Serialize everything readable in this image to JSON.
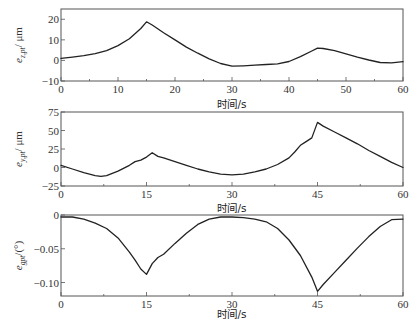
{
  "chart_data": [
    {
      "type": "line",
      "title": "",
      "xlabel": "时间/s",
      "ylabel": {
        "main": "e",
        "sub": "z,pt",
        "unit": "/ μm"
      },
      "xlim": [
        0,
        60
      ],
      "ylim": [
        -10,
        25
      ],
      "xticks": [
        0,
        10,
        20,
        30,
        40,
        50,
        60
      ],
      "xtick_labels": [
        "0",
        "10",
        "20",
        "30",
        "40",
        "50",
        "60"
      ],
      "xminor": [
        5,
        15,
        25,
        35,
        45,
        55
      ],
      "yticks": [
        -10,
        0,
        10,
        20
      ],
      "ytick_labels": [
        "−10",
        "0",
        "10",
        "20"
      ],
      "grid": false,
      "series": [
        {
          "name": "e_z,pt",
          "x": [
            0,
            2,
            4,
            6,
            8,
            10,
            12,
            14,
            15,
            16,
            18,
            20,
            22,
            24,
            26,
            28,
            30,
            32,
            34,
            36,
            38,
            40,
            42,
            44,
            45,
            46,
            48,
            50,
            52,
            54,
            56,
            58,
            60
          ],
          "y": [
            1,
            1.6,
            2.3,
            3.3,
            4.8,
            7.2,
            10.5,
            15.5,
            18.8,
            17.2,
            13.5,
            10,
            6.5,
            3.5,
            0.8,
            -1.5,
            -2.8,
            -2.6,
            -2.3,
            -2.0,
            -1.7,
            -0.5,
            1.8,
            4.6,
            6.0,
            5.8,
            4.8,
            3.2,
            1.6,
            0.2,
            -1.0,
            -1.2,
            -0.6
          ]
        }
      ]
    },
    {
      "type": "line",
      "title": "",
      "xlabel": "时间/s",
      "ylabel": {
        "main": "e",
        "sub": "y,pt",
        "unit": "/ μm"
      },
      "xlim": [
        0,
        60
      ],
      "ylim": [
        -25,
        75
      ],
      "xticks": [
        0,
        15,
        30,
        45,
        60
      ],
      "xtick_labels": [
        "0",
        "15",
        "30",
        "45",
        "60"
      ],
      "xminor": [
        7.5,
        22.5,
        37.5,
        52.5
      ],
      "yticks": [
        -25,
        0,
        25,
        50,
        75
      ],
      "ytick_labels": [
        "−25",
        "0",
        "25",
        "50",
        "75"
      ],
      "grid": false,
      "series": [
        {
          "name": "e_y,pt",
          "x": [
            0,
            2,
            4,
            6,
            7,
            8,
            10,
            12,
            13,
            14,
            15,
            16,
            17,
            18,
            20,
            22,
            24,
            26,
            28,
            30,
            32,
            34,
            36,
            38,
            40,
            41,
            42,
            43,
            44,
            45,
            46,
            48,
            50,
            52,
            54,
            56,
            58,
            60
          ],
          "y": [
            3,
            -2,
            -7,
            -11,
            -12,
            -11,
            -5,
            3,
            8,
            10,
            14,
            20,
            15,
            13,
            8,
            3,
            -2,
            -6,
            -9,
            -10,
            -9,
            -6,
            -2,
            4,
            13,
            21,
            30,
            35,
            40,
            61,
            56,
            48,
            40,
            32,
            23,
            15,
            7,
            0
          ]
        }
      ]
    },
    {
      "type": "line",
      "title": "",
      "xlabel": "时间/s",
      "ylabel": {
        "main": "e",
        "sub": "gpt",
        "unit": "/(°)"
      },
      "xlim": [
        0,
        60
      ],
      "ylim": [
        -0.12,
        0
      ],
      "xticks": [
        0,
        15,
        30,
        45,
        60
      ],
      "xtick_labels": [
        "0",
        "15",
        "30",
        "45",
        "60"
      ],
      "xminor": [
        7.5,
        22.5,
        37.5,
        52.5
      ],
      "yticks": [
        -0.1,
        -0.05,
        0
      ],
      "ytick_labels": [
        "−0.10",
        "−0.05",
        "0"
      ],
      "grid": false,
      "series": [
        {
          "name": "e_gpt",
          "x": [
            0,
            2,
            4,
            6,
            8,
            10,
            12,
            13,
            14,
            15,
            16,
            17,
            18,
            20,
            22,
            24,
            26,
            28,
            30,
            32,
            34,
            36,
            38,
            40,
            42,
            44,
            45,
            46,
            48,
            50,
            52,
            54,
            56,
            58,
            60
          ],
          "y": [
            -0.003,
            -0.003,
            -0.006,
            -0.012,
            -0.02,
            -0.034,
            -0.055,
            -0.067,
            -0.08,
            -0.088,
            -0.072,
            -0.063,
            -0.058,
            -0.042,
            -0.027,
            -0.014,
            -0.006,
            -0.003,
            -0.003,
            -0.004,
            -0.006,
            -0.01,
            -0.02,
            -0.037,
            -0.06,
            -0.092,
            -0.113,
            -0.103,
            -0.085,
            -0.067,
            -0.049,
            -0.032,
            -0.017,
            -0.007,
            -0.006
          ]
        }
      ]
    }
  ]
}
